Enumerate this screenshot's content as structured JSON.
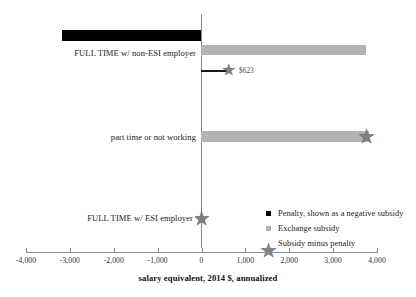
{
  "chart_data": {
    "type": "bar",
    "title": "",
    "subtitle": "",
    "xlabel": "salary equivalent, 2014 $, annualized",
    "ylabel": "",
    "xlim": [
      -4000,
      4000
    ],
    "ylim": null,
    "orientation": "horizontal",
    "grid": false,
    "legend_position": "inside-lower-right",
    "xticks": [
      -4000,
      -3000,
      -2000,
      -1000,
      0,
      1000,
      2000,
      3000,
      4000
    ],
    "xtick_labels": [
      "-4,000",
      "-3,000",
      "-2,000",
      "-1,000",
      "0",
      "1,000",
      "2,000",
      "3,000",
      "4,000"
    ],
    "categories": [
      "FULL TIME w/ non-ESI employer",
      "part time or not working",
      "FULL TIME w/ ESI employer"
    ],
    "series": [
      {
        "name": "Penalty, shown as a negative subsidy",
        "color": "#000000",
        "values": [
          -3170,
          0,
          0
        ]
      },
      {
        "name": "Exchange subsidy",
        "color": "#b3b3b3",
        "values": [
          3750,
          3800,
          0
        ]
      },
      {
        "name": "Subsidy minus penalty",
        "color": "#808080",
        "marker": "star",
        "values": [
          623,
          3750,
          0
        ]
      }
    ],
    "annotations": [
      {
        "text": "$623",
        "value": 623,
        "category": "FULL TIME w/ non-ESI employer",
        "series": "Subsidy minus penalty"
      }
    ]
  },
  "axis": {
    "title": "salary equivalent, 2014 $, annualized",
    "ticks": [
      {
        "label": "-4,000",
        "value": -4000
      },
      {
        "label": "-3,000",
        "value": -3000
      },
      {
        "label": "-2,000",
        "value": -2000
      },
      {
        "label": "-1,000",
        "value": -1000
      },
      {
        "label": "0",
        "value": 0
      },
      {
        "label": "1,000",
        "value": 1000
      },
      {
        "label": "2,000",
        "value": 2000
      },
      {
        "label": "3,000",
        "value": 3000
      },
      {
        "label": "4,000",
        "value": 4000
      }
    ]
  },
  "categories": {
    "non_esi": "FULL TIME w/ non-ESI employer",
    "part_time": "part time or not working",
    "esi": "FULL TIME w/ ESI employer"
  },
  "annotation": {
    "value_label": "$623"
  },
  "legend": {
    "items": [
      {
        "label": "Penalty, shown as a negative subsidy",
        "marker": "square-black"
      },
      {
        "label": "Exchange subsidy",
        "marker": "square-gray"
      },
      {
        "label": "Subsidy minus penalty",
        "marker": "star-gray"
      }
    ]
  },
  "glyphs": {
    "star": "★"
  }
}
